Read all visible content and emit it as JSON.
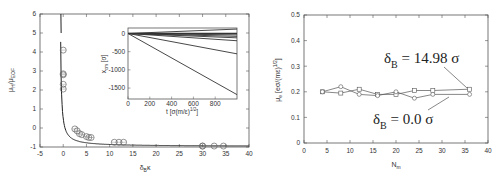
{
  "chart_data": [
    {
      "type": "scatter",
      "title": "",
      "xlabel": "δ_B κ",
      "ylabel": "μ_H / μ_EOF",
      "xlim": [
        -5,
        40
      ],
      "ylim": [
        -1,
        6
      ],
      "xticks": [
        "-5",
        "0",
        "5",
        "10",
        "15",
        "20",
        "25",
        "30",
        "35",
        "40"
      ],
      "yticks": [
        "-1",
        "0",
        "1",
        "2",
        "3",
        "4",
        "5",
        "6"
      ],
      "grid": false,
      "series": [
        {
          "name": "simulation points",
          "marker": "circle",
          "x": [
            0,
            0,
            0,
            0,
            0,
            2.5,
            3,
            3.5,
            4,
            5,
            5.5,
            6,
            11,
            12,
            13,
            30,
            30,
            32.5,
            34.5
          ],
          "y": [
            4.1,
            2.85,
            2.8,
            2.3,
            2.05,
            -0.05,
            -0.15,
            -0.3,
            -0.35,
            -0.45,
            -0.5,
            -0.5,
            -0.75,
            -0.75,
            -0.75,
            -0.95,
            -0.95,
            -0.95,
            -0.95
          ]
        },
        {
          "name": "theory curve",
          "marker": "line",
          "x": [
            -0.5,
            0,
            0.5,
            1,
            2,
            3,
            5,
            8,
            12,
            20,
            30,
            40
          ],
          "y": [
            6,
            3.6,
            2.0,
            1.2,
            0.45,
            0.1,
            -0.35,
            -0.6,
            -0.75,
            -0.87,
            -0.92,
            -0.95
          ]
        }
      ],
      "inset": {
        "type": "line",
        "xlabel": "t [σ(m/ε)^1/2]",
        "ylabel": "x_cm [σ]",
        "xlim": [
          0,
          1000
        ],
        "ylim": [
          -1800,
          150
        ],
        "xticks": [
          "0",
          "200",
          "400",
          "600",
          "800"
        ],
        "yticks": [
          "0",
          "-500",
          "-1000",
          "-1500"
        ],
        "series_endpoints_y_at_t1000": [
          120,
          0,
          -40,
          -80,
          -120,
          -200,
          -560,
          -1680
        ]
      }
    },
    {
      "type": "line",
      "title": "",
      "xlabel": "N_m",
      "ylabel": "μ_e [eσ/(mε)^1/2]",
      "xlim": [
        0,
        40
      ],
      "ylim": [
        0,
        0.5
      ],
      "xticks": [
        "0",
        "5",
        "10",
        "15",
        "20",
        "25",
        "30",
        "35",
        "40"
      ],
      "yticks": [
        "0",
        "0.1",
        "0.2",
        "0.3",
        "0.4",
        "0.5"
      ],
      "grid": false,
      "x": [
        4,
        8,
        12,
        16,
        20,
        24,
        28,
        36
      ],
      "series": [
        {
          "name": "δ_B = 14.98 σ",
          "marker": "square",
          "values": [
            0.2,
            0.195,
            0.21,
            0.19,
            0.19,
            0.205,
            0.205,
            0.21
          ]
        },
        {
          "name": "δ_B = 0.0 σ",
          "marker": "circle",
          "values": [
            0.2,
            0.22,
            0.19,
            0.185,
            0.2,
            0.175,
            0.19,
            0.19
          ]
        }
      ],
      "annotations": [
        {
          "text": "δ_B = 14.98 σ",
          "points_to": [
            36,
            0.21
          ]
        },
        {
          "text": "δ_B = 0.0 σ",
          "points_to": [
            30,
            0.19
          ]
        }
      ]
    }
  ],
  "left": {
    "ylabel_main": "μ",
    "ylabel_sub": "H",
    "ylabel_mid": "/μ",
    "ylabel_sub2": "EOF",
    "xlabel_main": "δ",
    "xlabel_sub": "B",
    "xlabel_tail": "κ",
    "inset_ylabel": "x",
    "inset_ylabel_sub": "cm",
    "inset_ylabel_tail": " [σ]",
    "inset_xlabel": "t [σ(m/ε)",
    "inset_xlabel_sup": "1/2",
    "inset_xlabel_tail": "]"
  },
  "right": {
    "ylabel_main": "μ",
    "ylabel_sub": "e",
    "ylabel_tail": " [eσ/(mε)",
    "ylabel_sup": "1/2",
    "ylabel_end": "]",
    "xlabel_main": "N",
    "xlabel_sub": "m",
    "legend1_main": "δ",
    "legend1_sub": "B",
    "legend1_tail": " = 14.98 σ",
    "legend2_main": "δ",
    "legend2_sub": "B",
    "legend2_tail": " = 0.0 σ"
  }
}
